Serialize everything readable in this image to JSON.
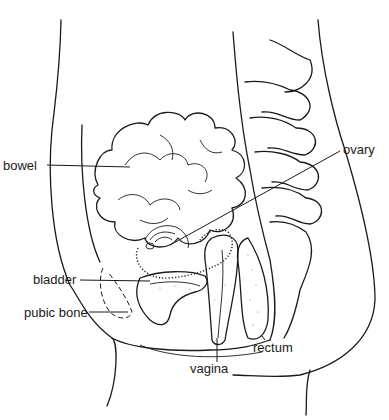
{
  "diagram": {
    "style": "black line drawing on white",
    "colors": {
      "ink": "#1a1a1a",
      "background": "#ffffff"
    },
    "labels": [
      {
        "id": "bowel",
        "text": "bowel",
        "x": 3,
        "y": 180
      },
      {
        "id": "ovary",
        "text": "ovary",
        "x": 343,
        "y": 147
      },
      {
        "id": "bladder",
        "text": "bladder",
        "x": 33,
        "y": 275
      },
      {
        "id": "pubic_bone",
        "text": "pubic bone",
        "x": 24,
        "y": 307
      },
      {
        "id": "rectum",
        "text": "rectum",
        "x": 253,
        "y": 342
      },
      {
        "id": "vagina",
        "text": "vagina",
        "x": 190,
        "y": 364
      }
    ]
  }
}
